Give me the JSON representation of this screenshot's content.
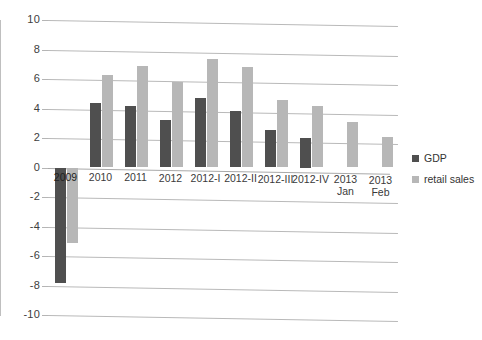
{
  "chart_data": {
    "type": "bar",
    "title": "",
    "subtitle": "",
    "xlabel": "",
    "ylabel": "",
    "ylim": [
      -10,
      10
    ],
    "yticks": [
      10,
      8,
      6,
      4,
      2,
      0,
      -2,
      -4,
      -6,
      -8,
      -10
    ],
    "ytick_labels": [
      "10",
      "8",
      "6",
      "4",
      "2",
      "0",
      "-2",
      "-4",
      "-6",
      "-8",
      "-10"
    ],
    "grid": true,
    "legend_position": "right",
    "categories": [
      "2009",
      "2010",
      "2011",
      "2012",
      "2012-I",
      "2012-II",
      "2012-III",
      "2012-IV",
      "2013 Jan",
      "2013 Feb"
    ],
    "category_lines": [
      [
        "2009",
        ""
      ],
      [
        "2010",
        ""
      ],
      [
        "2011",
        ""
      ],
      [
        "2012",
        ""
      ],
      [
        "2012-I",
        ""
      ],
      [
        "2012-II",
        ""
      ],
      [
        "2012-III",
        ""
      ],
      [
        "2012-IV",
        ""
      ],
      [
        "2013",
        "Jan"
      ],
      [
        "2013",
        "Feb"
      ]
    ],
    "series": [
      {
        "name": "GDP",
        "color": "#4f4f4f",
        "values": [
          -7.8,
          4.4,
          4.2,
          3.2,
          4.7,
          3.8,
          2.55,
          2.0,
          null,
          null
        ]
      },
      {
        "name": "retail sales",
        "color": "#b7b7b7",
        "values": [
          -5.1,
          6.3,
          6.85,
          5.8,
          7.35,
          6.8,
          4.55,
          4.2,
          3.1,
          2.1
        ]
      }
    ]
  },
  "legend": {
    "items": [
      {
        "label": "GDP",
        "color": "#4f4f4f"
      },
      {
        "label": "retail sales",
        "color": "#b7b7b7"
      }
    ]
  }
}
